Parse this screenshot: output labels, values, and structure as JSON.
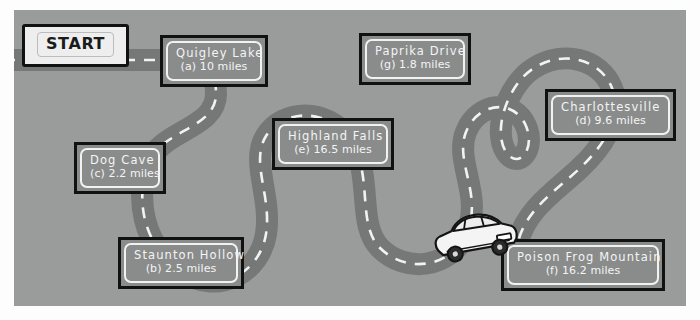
{
  "figure": {
    "type": "illustrated-road-map",
    "background_color": "#9a9b9b",
    "road_color": "#767878",
    "road_dash_color": "#f2f2f2",
    "sign_fill_color": "#8a8c8c",
    "sign_border_color": "#111111",
    "sign_text_color": "#f4f4f4",
    "car_body_color": "#f4f4f4",
    "car_outline_color": "#141414"
  },
  "start_marker": {
    "label": "START"
  },
  "signs": [
    {
      "id": "quigley-lake",
      "name": "Quigley Lake",
      "letter": "a",
      "distance_value": 10,
      "distance_text": "(a) 10 miles",
      "unit": "miles"
    },
    {
      "id": "staunton-hollow",
      "name": "Staunton Hollow",
      "letter": "b",
      "distance_value": 2.5,
      "distance_text": "(b) 2.5 miles",
      "unit": "miles"
    },
    {
      "id": "dog-cave",
      "name": "Dog Cave",
      "letter": "c",
      "distance_value": 2.2,
      "distance_text": "(c) 2.2 miles",
      "unit": "miles"
    },
    {
      "id": "charlottesville",
      "name": "Charlottesville",
      "letter": "d",
      "distance_value": 9.6,
      "distance_text": "(d) 9.6 miles",
      "unit": "miles"
    },
    {
      "id": "highland-falls",
      "name": "Highland Falls",
      "letter": "e",
      "distance_value": 16.5,
      "distance_text": "(e) 16.5 miles",
      "unit": "miles"
    },
    {
      "id": "poison-frog-mountain",
      "name": "Poison Frog Mountain",
      "letter": "f",
      "distance_value": 16.2,
      "distance_text": "(f) 16.2 miles",
      "unit": "miles"
    },
    {
      "id": "paprika-drive",
      "name": "Paprika Drive",
      "letter": "g",
      "distance_value": 1.8,
      "distance_text": "(g) 1.8 miles",
      "unit": "miles"
    }
  ],
  "vehicle": {
    "kind": "car-icon",
    "facing": "right"
  }
}
